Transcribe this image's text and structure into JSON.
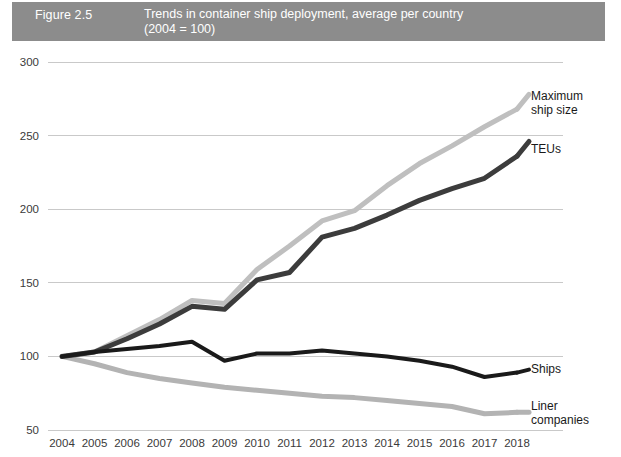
{
  "header": {
    "figure_number": "Figure 2.5",
    "title": "Trends in container ship deployment, average per country",
    "subtitle": "(2004 = 100)",
    "bar_color": "#8c8c8c",
    "text_color": "#ffffff"
  },
  "chart_data": {
    "type": "line",
    "title": "Trends in container ship deployment, average per country",
    "subtitle": "(2004 = 100)",
    "xlabel": "",
    "ylabel": "",
    "ylim": [
      50,
      300
    ],
    "yticks": [
      50,
      100,
      150,
      200,
      250,
      300
    ],
    "ytick_labels": [
      "50",
      "100",
      "150",
      "200",
      "250",
      "300"
    ],
    "grid": true,
    "grid_axis": "y",
    "legend_position": "right-inline-labels",
    "categories": [
      2004,
      2005,
      2006,
      2007,
      2008,
      2009,
      2010,
      2011,
      2012,
      2013,
      2014,
      2015,
      2016,
      2017,
      2018
    ],
    "xtick_labels": [
      "2004",
      "2005",
      "2006",
      "2007",
      "2008",
      "2009",
      "2010",
      "2011",
      "2012",
      "2013",
      "2014",
      "2015",
      "2016",
      "2017",
      "2018"
    ],
    "series": [
      {
        "name": "Maximum ship size",
        "label": "Maximum\nship size",
        "color": "#bfbfbf",
        "width": 5,
        "values": [
          100,
          103,
          114,
          125,
          138,
          136,
          159,
          175,
          192,
          199,
          216,
          231,
          243,
          256,
          268
        ]
      },
      {
        "name": "TEUs",
        "label": "TEUs",
        "color": "#3c3c3c",
        "width": 5,
        "values": [
          100,
          103,
          112,
          122,
          134,
          132,
          152,
          157,
          181,
          187,
          196,
          206,
          214,
          221,
          236
        ]
      },
      {
        "name": "Ships",
        "label": "Ships",
        "color": "#1a1a1a",
        "width": 4,
        "values": [
          100,
          103,
          105,
          107,
          110,
          97,
          102,
          102,
          104,
          102,
          100,
          97,
          93,
          86,
          89
        ]
      },
      {
        "name": "Liner companies",
        "label": "Liner\ncompanies",
        "color": "#b3b3b3",
        "width": 5,
        "values": [
          100,
          95,
          89,
          85,
          82,
          79,
          77,
          75,
          73,
          72,
          70,
          68,
          66,
          61,
          62
        ]
      }
    ]
  },
  "series_labels": {
    "maximum_ship_size_line1": "Maximum",
    "maximum_ship_size_line2": "ship size",
    "teus": "TEUs",
    "ships": "Ships",
    "liner_companies_line1": "Liner",
    "liner_companies_line2": "companies"
  }
}
